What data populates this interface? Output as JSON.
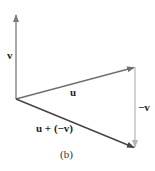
{
  "diagram": {
    "caption": "(b)",
    "vectors": [
      {
        "name": "v",
        "label": "v",
        "from": [
          16,
          99
        ],
        "to": [
          16,
          14
        ],
        "color": "#7a7a7a"
      },
      {
        "name": "u",
        "label": "u",
        "from": [
          16,
          99
        ],
        "to": [
          135,
          67
        ],
        "color": "#6f6f6f"
      },
      {
        "name": "neg-v",
        "label": "−v",
        "from": [
          135,
          67
        ],
        "to": [
          135,
          148
        ],
        "color": "#b5b5b5"
      },
      {
        "name": "u-plus-neg-v",
        "label": "u + (−v)",
        "from": [
          16,
          99
        ],
        "to": [
          135,
          148
        ],
        "color": "#444444"
      }
    ]
  }
}
